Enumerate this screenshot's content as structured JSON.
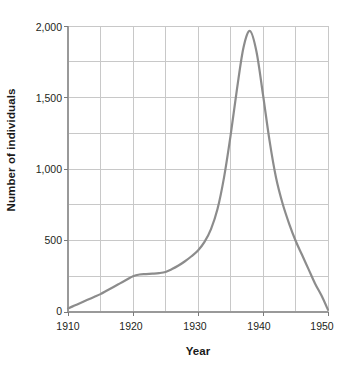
{
  "chart_data": {
    "type": "line",
    "title": "",
    "xlabel": "Year",
    "ylabel": "Number of individuals",
    "xlim": [
      1910,
      1950
    ],
    "ylim": [
      0,
      2000
    ],
    "xticks": [
      "1910",
      "1920",
      "1930",
      "1940",
      "1950"
    ],
    "xtick_values": [
      1910,
      1920,
      1930,
      1940,
      1950
    ],
    "yticks": [
      "0",
      "500",
      "1,000",
      "1,500",
      "2,000"
    ],
    "ytick_values": [
      0,
      500,
      1000,
      1500,
      2000
    ],
    "x_minor_step": 5,
    "y_minor_step": 250,
    "grid": true,
    "legend": "none",
    "line_color": "#8c8c8c",
    "line_width": 2.2,
    "axis_color": "#b3b3b3",
    "grid_color": "#c8c8c8",
    "series": [
      {
        "name": "Number of individuals",
        "x": [
          1910,
          1911,
          1912,
          1913,
          1914,
          1915,
          1916,
          1917,
          1918,
          1919,
          1920,
          1921,
          1922,
          1923,
          1924,
          1925,
          1926,
          1927,
          1928,
          1929,
          1930,
          1931,
          1932,
          1933,
          1934,
          1935,
          1936,
          1937,
          1938,
          1939,
          1940,
          1941,
          1942,
          1943,
          1944,
          1945,
          1946,
          1947,
          1948,
          1949,
          1950
        ],
        "values": [
          25,
          45,
          65,
          85,
          105,
          125,
          150,
          175,
          200,
          225,
          250,
          262,
          265,
          268,
          272,
          280,
          300,
          325,
          355,
          390,
          430,
          490,
          580,
          720,
          940,
          1230,
          1560,
          1850,
          1965,
          1820,
          1520,
          1200,
          940,
          760,
          620,
          500,
          400,
          300,
          200,
          115,
          15
        ]
      }
    ],
    "peak": {
      "x": 1938,
      "y": 1965
    }
  }
}
